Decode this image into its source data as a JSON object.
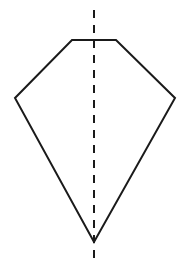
{
  "diagram": {
    "shape": "kite-pentagon",
    "stroke_color": "#1a1a1a",
    "background": "#ffffff",
    "vertices": [
      [
        72,
        40
      ],
      [
        116,
        40
      ],
      [
        175,
        98
      ],
      [
        94,
        242
      ],
      [
        15,
        98
      ]
    ],
    "axis": {
      "x": 94,
      "y_start": 10,
      "y_end": 265,
      "style": "dashed"
    }
  }
}
